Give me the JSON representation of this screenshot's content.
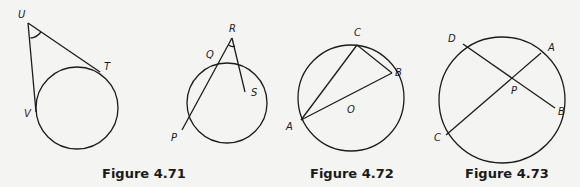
{
  "figures": [
    {
      "caption": "Figure 4.71",
      "labels": {
        "U": "U",
        "T": "T",
        "V": "V"
      }
    },
    {
      "caption": "",
      "labels": {
        "R": "R",
        "Q": "Q",
        "S": "S",
        "P": "P"
      }
    },
    {
      "caption": "Figure 4.72",
      "labels": {
        "C": "C",
        "B": "B",
        "A": "A",
        "O": "O"
      }
    },
    {
      "caption": "Figure 4.73",
      "labels": {
        "D": "D",
        "A": "A",
        "B": "B",
        "C": "C",
        "P": "P"
      }
    }
  ],
  "colors": {
    "ink": "#1c1c1c",
    "paper": "#f4f4f2"
  }
}
